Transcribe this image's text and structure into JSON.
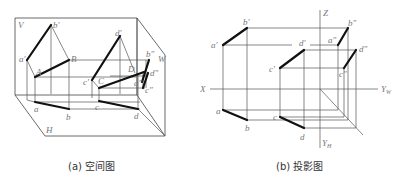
{
  "figure_a": {
    "caption": "(a) 空间图",
    "plane_labels": {
      "V": "V",
      "H": "H",
      "W": "W"
    },
    "points": {
      "a_prime": "a'",
      "b_prime": "b'",
      "A": "A",
      "B": "B",
      "a": "a",
      "b": "b",
      "c_prime": "c'",
      "C": "C",
      "d_prime": "d'",
      "D": "D",
      "c": "c",
      "d": "d",
      "b_dprime": "b\"",
      "a_dprime": "a\"",
      "d_dprime": "d\"",
      "c_dprime": "c\""
    }
  },
  "figure_b": {
    "caption": "(b) 投影图",
    "axes": {
      "Z": "Z",
      "X": "X",
      "YW": "Y",
      "YW_sub": "W",
      "YH": "Y",
      "YH_sub": "H"
    },
    "points": {
      "a_prime": "a'",
      "b_prime": "b'",
      "c_prime": "c'",
      "d_prime": "d'",
      "a": "a",
      "b": "b",
      "c": "c",
      "d": "d",
      "a_dprime": "a\"",
      "b_dprime": "b\"",
      "c_dprime": "c\"",
      "d_dprime": "d\""
    }
  }
}
